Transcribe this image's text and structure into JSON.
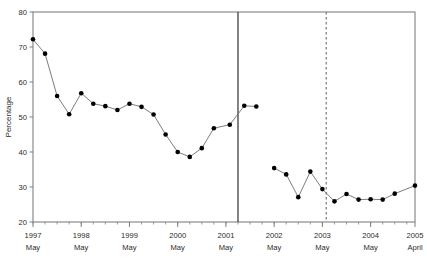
{
  "chart_data": {
    "type": "line",
    "title": "",
    "subtitle": "",
    "xlabel": "",
    "ylabel": "Percentage",
    "ylim": [
      20,
      80
    ],
    "yticks": [
      20,
      30,
      40,
      50,
      60,
      70,
      80
    ],
    "ytick_labels": [
      "20",
      "30",
      "40",
      "50",
      "60",
      "70",
      "80"
    ],
    "xlim": [
      1997.37,
      2005.29
    ],
    "grid": false,
    "legend": null,
    "xtick_labels": [
      {
        "year": "1997",
        "month": "May",
        "x": 1997.37
      },
      {
        "year": "1998",
        "month": "May",
        "x": 1998.37
      },
      {
        "year": "1999",
        "month": "May",
        "x": 1999.37
      },
      {
        "year": "2000",
        "month": "May",
        "x": 2000.37
      },
      {
        "year": "2001",
        "month": "May",
        "x": 2001.37
      },
      {
        "year": "2002",
        "month": "May",
        "x": 2002.37
      },
      {
        "year": "2003",
        "month": "May",
        "x": 2003.37
      },
      {
        "year": "2004",
        "month": "May",
        "x": 2004.37
      },
      {
        "year": "2005",
        "month": "April",
        "x": 2005.29
      }
    ],
    "minor_tick_interval": 0.25,
    "annotations": [
      {
        "name": "solid-divider",
        "type": "vline",
        "style": "solid",
        "x": 2001.62
      },
      {
        "name": "dashed-divider",
        "type": "vline",
        "style": "dashed",
        "x": 2003.45
      }
    ],
    "series": [
      {
        "name": "series-1",
        "marker": "filled-circle",
        "line": "solid",
        "points": [
          {
            "x": 1997.37,
            "y": 72.2
          },
          {
            "x": 1997.62,
            "y": 68.1
          },
          {
            "x": 1997.87,
            "y": 56.0
          },
          {
            "x": 1998.12,
            "y": 50.8
          },
          {
            "x": 1998.37,
            "y": 56.8
          },
          {
            "x": 1998.62,
            "y": 53.8
          },
          {
            "x": 1998.87,
            "y": 53.1
          },
          {
            "x": 1999.12,
            "y": 52.0
          },
          {
            "x": 1999.37,
            "y": 53.8
          },
          {
            "x": 1999.62,
            "y": 52.9
          },
          {
            "x": 1999.87,
            "y": 50.7
          },
          {
            "x": 2000.12,
            "y": 45.0
          },
          {
            "x": 2000.37,
            "y": 40.0
          },
          {
            "x": 2000.62,
            "y": 38.6
          },
          {
            "x": 2000.87,
            "y": 41.1
          },
          {
            "x": 2001.12,
            "y": 46.8
          },
          {
            "x": 2001.45,
            "y": 47.8
          },
          {
            "x": 2001.75,
            "y": 53.2
          },
          {
            "x": 2002.0,
            "y": 53.0
          }
        ]
      },
      {
        "name": "series-2",
        "marker": "filled-circle",
        "line": "solid",
        "points": [
          {
            "x": 2002.37,
            "y": 35.4
          },
          {
            "x": 2002.62,
            "y": 33.6
          },
          {
            "x": 2002.87,
            "y": 27.1
          },
          {
            "x": 2003.12,
            "y": 34.4
          },
          {
            "x": 2003.37,
            "y": 29.4
          },
          {
            "x": 2003.62,
            "y": 25.9
          },
          {
            "x": 2003.87,
            "y": 28.0
          },
          {
            "x": 2004.12,
            "y": 26.4
          },
          {
            "x": 2004.37,
            "y": 26.5
          },
          {
            "x": 2004.62,
            "y": 26.4
          },
          {
            "x": 2004.87,
            "y": 28.1
          },
          {
            "x": 2005.29,
            "y": 30.4
          }
        ]
      }
    ],
    "colors": {
      "line": "#6e6e6e",
      "marker": "#000000",
      "frame": "#808080",
      "divider_solid": "#4d4d4d",
      "divider_dashed": "#808080",
      "text": "#2b2b2b",
      "background": "#ffffff"
    }
  }
}
